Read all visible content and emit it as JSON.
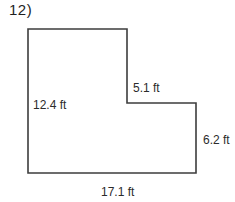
{
  "problem": {
    "number_label": "12)"
  },
  "figure": {
    "type": "l-shaped-polygon",
    "unit": "ft",
    "stroke_color": "#3d3d3d",
    "text_color": "#2b2b2b",
    "labels": {
      "left_side": "12.4 ft",
      "notch_side": "5.1 ft",
      "right_side": "6.2 ft",
      "bottom_side": "17.1 ft"
    },
    "dimensions": {
      "left_side_ft": 12.4,
      "notch_side_ft": 5.1,
      "right_side_ft": 6.2,
      "bottom_side_ft": 17.1
    }
  }
}
